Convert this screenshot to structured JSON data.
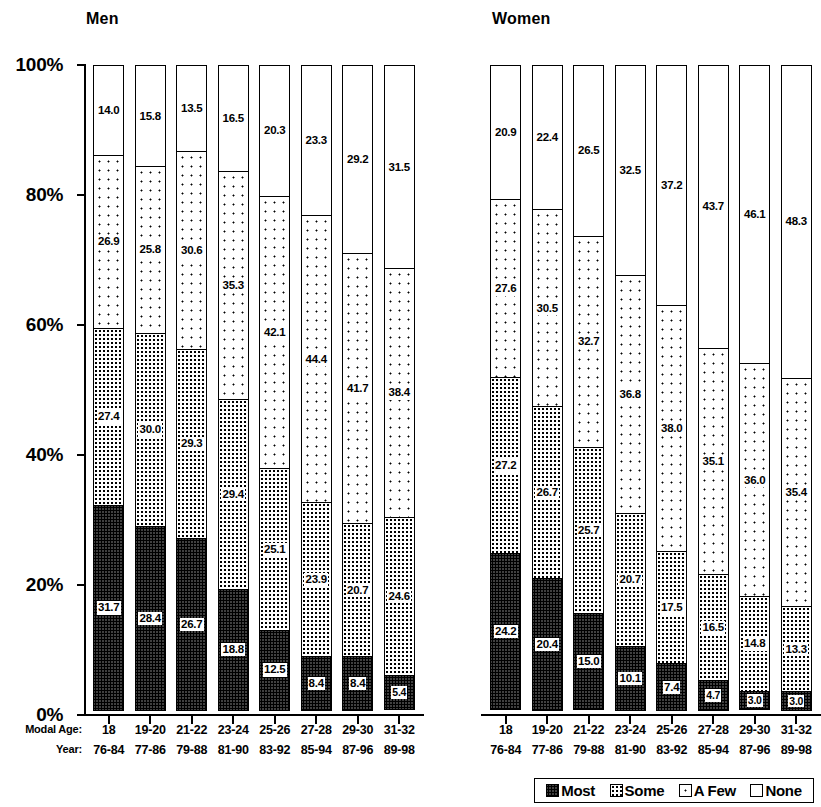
{
  "chart_data": {
    "type": "bar",
    "subtype": "stacked-percentage",
    "title": "",
    "panels": [
      {
        "name": "men",
        "title": "Men",
        "categories": [
          "18",
          "19-20",
          "21-22",
          "23-24",
          "25-26",
          "27-28",
          "29-30",
          "31-32"
        ],
        "categories_year": [
          "76-84",
          "77-86",
          "79-88",
          "81-90",
          "83-92",
          "85-94",
          "87-96",
          "89-98"
        ],
        "series": [
          {
            "name": "Most",
            "values": [
              31.7,
              28.4,
              26.7,
              18.8,
              12.5,
              8.4,
              8.4,
              5.4
            ]
          },
          {
            "name": "Some",
            "values": [
              27.4,
              30.0,
              29.3,
              29.4,
              25.1,
              23.9,
              20.7,
              24.6
            ]
          },
          {
            "name": "A Few",
            "values": [
              26.9,
              25.8,
              30.6,
              35.3,
              42.1,
              44.4,
              41.7,
              38.4
            ]
          },
          {
            "name": "None",
            "values": [
              14.0,
              15.8,
              13.5,
              16.5,
              20.3,
              23.3,
              29.2,
              31.5
            ]
          }
        ]
      },
      {
        "name": "women",
        "title": "Women",
        "categories": [
          "18",
          "19-20",
          "21-22",
          "23-24",
          "25-26",
          "27-28",
          "29-30",
          "31-32"
        ],
        "categories_year": [
          "76-84",
          "77-86",
          "79-88",
          "81-90",
          "83-92",
          "85-94",
          "87-96",
          "89-98"
        ],
        "series": [
          {
            "name": "Most",
            "values": [
              24.2,
              20.4,
              15.0,
              10.1,
              7.4,
              4.7,
              3.0,
              3.0
            ]
          },
          {
            "name": "Some",
            "values": [
              27.2,
              26.7,
              25.7,
              20.7,
              17.5,
              16.5,
              14.8,
              13.3
            ]
          },
          {
            "name": "A Few",
            "values": [
              27.6,
              30.5,
              32.7,
              36.8,
              38.0,
              35.1,
              36.0,
              35.4
            ]
          },
          {
            "name": "None",
            "values": [
              20.9,
              22.4,
              26.5,
              32.5,
              37.2,
              43.7,
              46.1,
              48.3
            ]
          }
        ]
      }
    ],
    "y_ticks": [
      "0%",
      "20%",
      "40%",
      "60%",
      "80%",
      "100%"
    ],
    "ylim": [
      0,
      100
    ],
    "ylabel": "",
    "xlabel": "",
    "axis_row_labels": {
      "age": "Modal Age:",
      "year": "Year:"
    },
    "legend": {
      "position": "bottom-right",
      "entries": [
        {
          "label": "Most",
          "pattern": "dense-dither"
        },
        {
          "label": "Some",
          "pattern": "medium-dither"
        },
        {
          "label": "A Few",
          "pattern": "sparse-dots"
        },
        {
          "label": "None",
          "pattern": "white"
        }
      ]
    },
    "grid": false,
    "colors": {
      "ink": "#000000",
      "background": "#ffffff"
    }
  }
}
